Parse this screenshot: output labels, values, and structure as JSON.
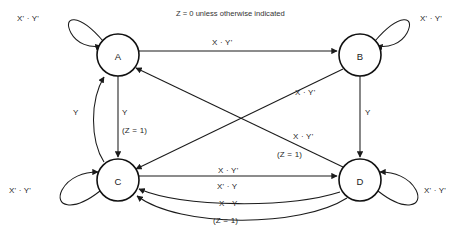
{
  "diagram": {
    "title_note": "Z = 0 unless otherwise indicated",
    "type": "finite-state-machine",
    "nodes": [
      {
        "id": "A",
        "label": "A",
        "cx": 118,
        "cy": 55,
        "r": 21
      },
      {
        "id": "B",
        "label": "B",
        "cx": 360,
        "cy": 55,
        "r": 21
      },
      {
        "id": "C",
        "label": "C",
        "cx": 118,
        "cy": 180,
        "r": 21
      },
      {
        "id": "D",
        "label": "D",
        "cx": 360,
        "cy": 180,
        "r": 21
      }
    ],
    "self_loops": [
      {
        "node": "A",
        "label": "X' · Y'",
        "position": "top-left"
      },
      {
        "node": "B",
        "label": "X' · Y'",
        "position": "top-right"
      },
      {
        "node": "C",
        "label": "X' · Y'",
        "position": "bottom-left"
      },
      {
        "node": "D",
        "label": "X' · Y'",
        "position": "bottom-right"
      }
    ],
    "transitions": [
      {
        "from": "A",
        "to": "B",
        "label": "X · Y'",
        "output": ""
      },
      {
        "from": "A",
        "to": "C",
        "label": "Y",
        "output": "(Z = 1)"
      },
      {
        "from": "C",
        "to": "A",
        "label": "Y",
        "output": ""
      },
      {
        "from": "B",
        "to": "D",
        "label": "Y",
        "output": ""
      },
      {
        "from": "B",
        "to": "C",
        "label": "X · Y'",
        "output": ""
      },
      {
        "from": "D",
        "to": "A",
        "label": "X · Y'",
        "output": "(Z = 1)"
      },
      {
        "from": "C",
        "to": "D",
        "label": "X · Y'",
        "output": ""
      },
      {
        "from": "D",
        "to": "C",
        "label": "X' · Y",
        "output": ""
      },
      {
        "from": "D",
        "to": "C",
        "label": "X · Y",
        "output": "(Z = 1)"
      }
    ],
    "labels": {
      "loop_a": "X' · Y'",
      "loop_b": "X' · Y'",
      "loop_c": "X' · Y'",
      "loop_d": "X' · Y'",
      "a_to_b": "X · Y'",
      "c_to_a": "Y",
      "a_to_c": "Y",
      "a_to_c_out": "(Z = 1)",
      "b_to_d": "Y",
      "b_to_c": "X · Y'",
      "d_to_a": "X · Y'",
      "d_to_a_out": "(Z = 1)",
      "c_to_d": "X · Y'",
      "d_to_c_1": "X' · Y",
      "d_to_c_2": "X · Y",
      "d_to_c_2_out": "(Z = 1)"
    },
    "colors": {
      "stroke": "#1b1b1b",
      "node_stroke": "#111111",
      "text": "#262626",
      "background": "#ffffff"
    }
  }
}
